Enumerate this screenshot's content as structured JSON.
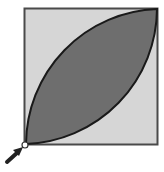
{
  "diagram": {
    "colors": {
      "background": "#ffffff",
      "square_fill": "#d6d6d6",
      "square_stroke": "#4a4a4a",
      "lens_fill": "#6e6e6e",
      "lens_stroke": "#1a1a1a",
      "arrow": "#222222",
      "marker_fill": "#ffffff"
    },
    "square": {
      "x": 24,
      "y": 8,
      "size": 134
    },
    "lens": {
      "from_corner": "bottom-left",
      "to_corner": "top-right"
    },
    "marker": {
      "corner": "bottom-left",
      "shape": "small-circle"
    },
    "arrow": {
      "points_to": "bottom-left-corner",
      "direction": "up-right"
    }
  }
}
